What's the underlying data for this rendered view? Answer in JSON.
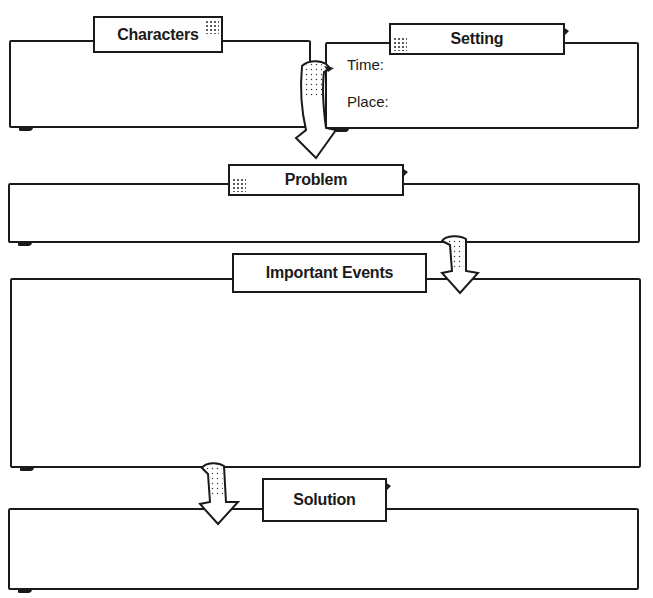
{
  "diagram": {
    "type": "story-map-graphic-organizer",
    "sections": [
      {
        "id": "characters",
        "label": "Characters"
      },
      {
        "id": "setting",
        "label": "Setting",
        "fields": [
          {
            "label": "Time:",
            "value": ""
          },
          {
            "label": "Place:",
            "value": ""
          }
        ]
      },
      {
        "id": "problem",
        "label": "Problem"
      },
      {
        "id": "important_events",
        "label": "Important Events"
      },
      {
        "id": "solution",
        "label": "Solution"
      }
    ],
    "flow": [
      "characters",
      "problem",
      "important_events",
      "solution"
    ],
    "colors": {
      "ink": "#1a1a1a",
      "background": "#ffffff"
    }
  }
}
